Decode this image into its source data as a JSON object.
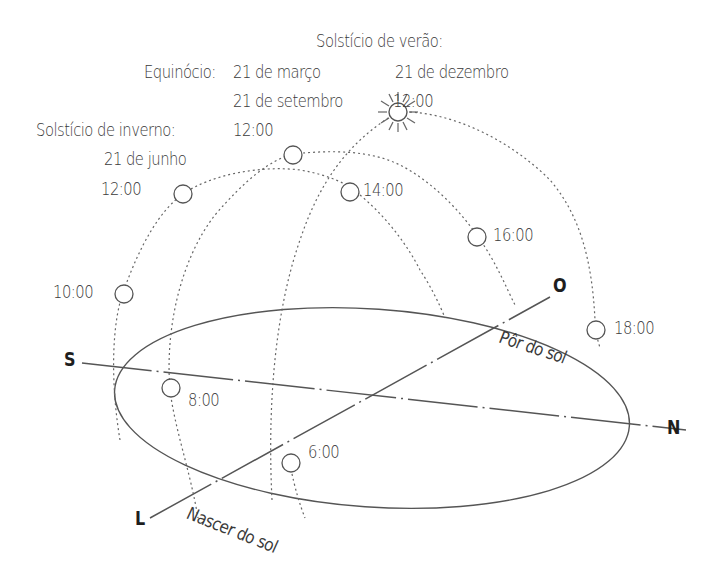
{
  "diagram": {
    "type": "sun-path-diagram",
    "labels": {
      "summer_solstice_title": "Solstício de verão:",
      "summer_solstice_date": "21 de dezembro",
      "summer_solstice_time": "12:00",
      "equinox_title": "Equinócio:",
      "equinox_date_1": "21 de março",
      "equinox_date_2": "21 de setembro",
      "equinox_time": "12:00",
      "winter_solstice_title": "Solstício de inverno:",
      "winter_solstice_date": "21 de junho",
      "winter_solstice_time": "12:00"
    },
    "hours": {
      "h6": "6:00",
      "h8": "8:00",
      "h10": "10:00",
      "h14": "14:00",
      "h16": "16:00",
      "h18": "18:00"
    },
    "cardinals": {
      "south": "S",
      "north": "N",
      "east": "L",
      "west": "O"
    },
    "annotations": {
      "sunset": "Pôr do sol",
      "sunrise": "Nascer do sol"
    },
    "colors": {
      "line": "#555555",
      "text": "#3a3a3a",
      "background": "#ffffff"
    }
  }
}
